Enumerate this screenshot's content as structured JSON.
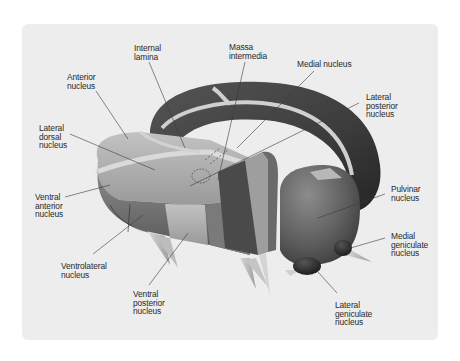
{
  "diagram": {
    "style": "grayscale 3D anatomical illustration",
    "colors": {
      "background": "#ffffff",
      "panel": "#ededed",
      "label_text": "#2a2a2a",
      "leader_line": "#3a3a3a",
      "lamina": "#d6d6d6",
      "dark_nucleus": "#3e3e3e",
      "mid_nucleus": "#6e6e6e",
      "light_nucleus": "#a8a8a8"
    },
    "labels": [
      {
        "id": "internal-lamina",
        "text": "Internal\nlamina",
        "x": 134,
        "y": 44
      },
      {
        "id": "massa-intermedia",
        "text": "Massa\nintermedia",
        "x": 229,
        "y": 43
      },
      {
        "id": "anterior-nucleus",
        "text": "Anterior\nnucleus",
        "x": 67,
        "y": 73
      },
      {
        "id": "medial-nucleus",
        "text": "Medial nucleus",
        "x": 297,
        "y": 60
      },
      {
        "id": "lateral-posterior-nucleus",
        "text": "Lateral\nposterior\nnucleus",
        "x": 366,
        "y": 93
      },
      {
        "id": "lateral-dorsal-nucleus",
        "text": "Lateral\ndorsal\nnucleus",
        "x": 39,
        "y": 124
      },
      {
        "id": "ventral-anterior-nucleus",
        "text": "Ventral\nanterior\nnucleus",
        "x": 35,
        "y": 193
      },
      {
        "id": "pulvinar-nucleus",
        "text": "Pulvinar\nnucleus",
        "x": 391,
        "y": 185
      },
      {
        "id": "medial-geniculate-nucleus",
        "text": "Medial\ngeniculate\nnucleus",
        "x": 391,
        "y": 232
      },
      {
        "id": "ventrolateral-nucleus",
        "text": "Ventrolateral\nnucleus",
        "x": 61,
        "y": 262
      },
      {
        "id": "ventral-posterior-nucleus",
        "text": "Ventral\nposterior\nnucleus",
        "x": 133,
        "y": 290
      },
      {
        "id": "lateral-geniculate-nucleus",
        "text": "Lateral\ngeniculate\nnucleus",
        "x": 335,
        "y": 301
      }
    ],
    "leader_lines": [
      {
        "for": "internal-lamina",
        "x1": 149,
        "y1": 62,
        "x2": 185,
        "y2": 148
      },
      {
        "for": "massa-intermedia",
        "x1": 245,
        "y1": 62,
        "x2": 218,
        "y2": 180
      },
      {
        "for": "anterior-nucleus",
        "x1": 96,
        "y1": 91,
        "x2": 128,
        "y2": 139
      },
      {
        "for": "medial-nucleus",
        "x1": 314,
        "y1": 71,
        "x2": 237,
        "y2": 148
      },
      {
        "for": "lateral-posterior-nucleus",
        "x1": 359,
        "y1": 103,
        "x2": 190,
        "y2": 186
      },
      {
        "for": "lateral-dorsal-nucleus",
        "x1": 70,
        "y1": 134,
        "x2": 155,
        "y2": 170
      },
      {
        "for": "ventral-anterior-nucleus",
        "x1": 65,
        "y1": 197,
        "x2": 110,
        "y2": 185
      },
      {
        "for": "pulvinar-nucleus",
        "x1": 385,
        "y1": 194,
        "x2": 318,
        "y2": 218
      },
      {
        "for": "medial-geniculate-nucleus",
        "x1": 385,
        "y1": 238,
        "x2": 347,
        "y2": 249
      },
      {
        "for": "ventrolateral-nucleus",
        "x1": 93,
        "y1": 254,
        "x2": 143,
        "y2": 215
      },
      {
        "for": "ventral-posterior-nucleus",
        "x1": 149,
        "y1": 285,
        "x2": 188,
        "y2": 233
      },
      {
        "for": "lateral-geniculate-nucleus",
        "x1": 337,
        "y1": 293,
        "x2": 318,
        "y2": 272
      }
    ]
  }
}
